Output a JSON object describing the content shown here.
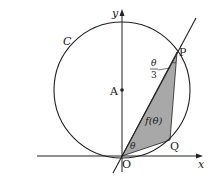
{
  "diagram": {
    "circle_label": "C",
    "center_label": "A",
    "point_p_label": "P",
    "point_q_label": "Q",
    "origin_label": "O",
    "x_axis_label": "x",
    "y_axis_label": "y",
    "angle_at_origin_label": "θ",
    "angle_at_p_numerator": "θ",
    "angle_at_p_denominator": "3",
    "area_label": "f(θ)",
    "colors": {
      "stroke": "#222222",
      "shaded_region": "#a8a8a8",
      "background": "#ffffff"
    }
  }
}
